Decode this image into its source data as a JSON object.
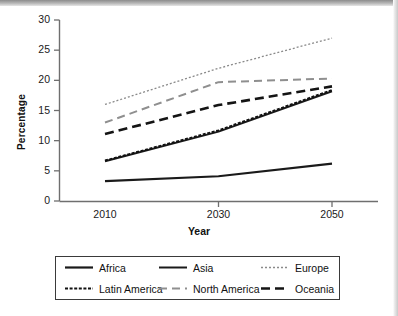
{
  "chart_data": {
    "type": "line",
    "title": "",
    "xlabel": "Year",
    "ylabel": "Percentage",
    "x": [
      2010,
      2030,
      2050
    ],
    "xtick_labels": [
      "2010",
      "2030",
      "2050"
    ],
    "ytick_labels": [
      "0",
      "5",
      "10",
      "15",
      "20",
      "25",
      "30"
    ],
    "ytick_values": [
      0,
      5,
      10,
      15,
      20,
      25,
      30
    ],
    "ylim": [
      0,
      30
    ],
    "xlim": [
      2010,
      2050
    ],
    "grid": false,
    "legend_position": "below-plot",
    "legend_columns": 3,
    "series": [
      {
        "name": "Africa",
        "values": [
          3.3,
          4.1,
          6.2
        ],
        "style": "solid",
        "color": "#1a1a1a",
        "width": 2.2,
        "dash": ""
      },
      {
        "name": "Asia",
        "values": [
          6.6,
          11.5,
          18.2
        ],
        "style": "solid",
        "color": "#1a1a1a",
        "width": 2.0,
        "dash": ""
      },
      {
        "name": "Europe",
        "values": [
          16.0,
          22.0,
          27.0
        ],
        "style": "dotted",
        "color": "#8a8a8a",
        "width": 1.3,
        "dash": "2,2"
      },
      {
        "name": "Latin America",
        "values": [
          6.7,
          11.7,
          18.4
        ],
        "style": "fine-dashed",
        "color": "#111111",
        "width": 2.0,
        "dash": "3,1.6"
      },
      {
        "name": "North America",
        "values": [
          13.0,
          19.7,
          20.3
        ],
        "style": "dashed",
        "color": "#8f8f8f",
        "width": 2.0,
        "dash": "8,5"
      },
      {
        "name": "Oceania",
        "values": [
          11.1,
          15.9,
          19.0
        ],
        "style": "dashed",
        "color": "#141414",
        "width": 2.6,
        "dash": "9,5"
      }
    ]
  },
  "axes": {
    "ylabel": "Percentage",
    "xlabel": "Year",
    "yticks": [
      "0",
      "5",
      "10",
      "15",
      "20",
      "25",
      "30"
    ],
    "xticks": [
      "2010",
      "2030",
      "2050"
    ]
  },
  "legend": {
    "entries": [
      {
        "label": "Africa",
        "swatch": "solid-thick-black"
      },
      {
        "label": "Asia",
        "swatch": "solid-thin-black"
      },
      {
        "label": "Europe",
        "swatch": "dotted-gray"
      },
      {
        "label": "Latin America",
        "swatch": "fine-dashed-black"
      },
      {
        "label": "North America",
        "swatch": "dashed-gray"
      },
      {
        "label": "Oceania",
        "swatch": "dashed-thick-black"
      }
    ]
  },
  "colors": {
    "axis": "#6f6f6f",
    "text": "#1a1a1a",
    "black_series": "#1a1a1a",
    "gray_series": "#8c8c8c",
    "legend_border": "#3a3a3a"
  }
}
